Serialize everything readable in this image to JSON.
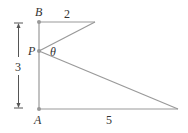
{
  "diagram": {
    "points": {
      "B": {
        "label": "B"
      },
      "P": {
        "label": "P"
      },
      "A": {
        "label": "A"
      }
    },
    "angle_label": "θ",
    "top_length_label": "2",
    "bottom_length_label": "5",
    "height_label": "3",
    "colors": {
      "line": "#999999",
      "point": "#999999",
      "text": "#333333"
    }
  }
}
